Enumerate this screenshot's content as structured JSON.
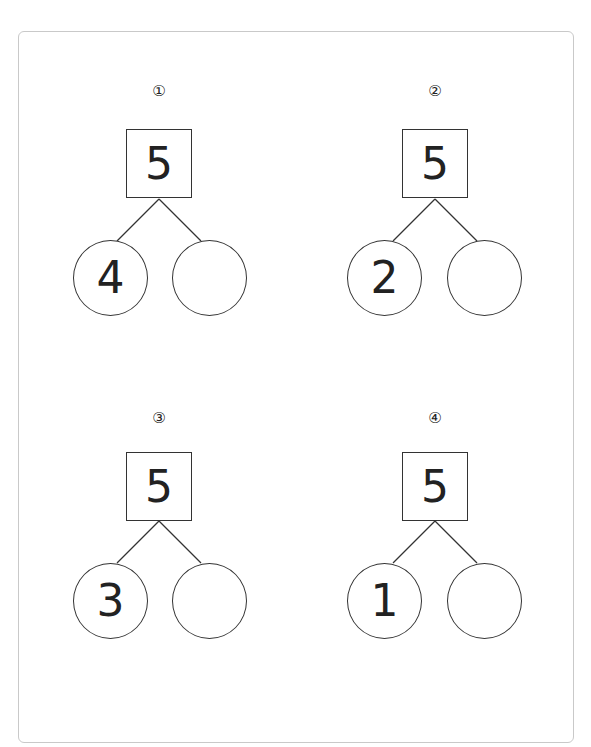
{
  "worksheet": {
    "problems": [
      {
        "marker": "①",
        "whole": "5",
        "left_part": "4",
        "right_part": ""
      },
      {
        "marker": "②",
        "whole": "5",
        "left_part": "2",
        "right_part": ""
      },
      {
        "marker": "③",
        "whole": "5",
        "left_part": "3",
        "right_part": ""
      },
      {
        "marker": "④",
        "whole": "5",
        "left_part": "1",
        "right_part": ""
      }
    ]
  },
  "colors": {
    "frame_border": "#c9c9c9",
    "stroke": "#333333",
    "text": "#222222",
    "background": "#ffffff"
  }
}
